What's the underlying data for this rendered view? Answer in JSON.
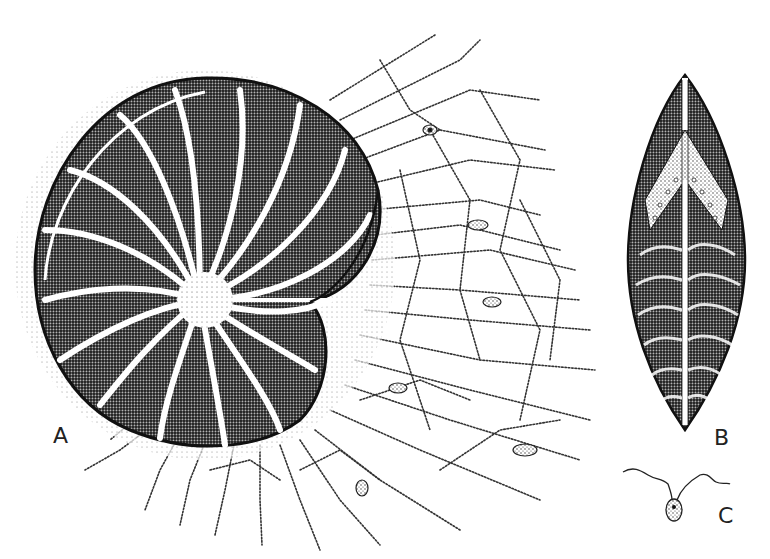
{
  "figure": {
    "type": "scientific-stipple-illustration",
    "background": "#ffffff",
    "ink": "#1a1a1a",
    "panels": [
      {
        "id": "A",
        "label": "A",
        "description": "coiled multi-chambered shell with radiating reticulate pseudopodial network"
      },
      {
        "id": "B",
        "label": "B",
        "description": "elongate spindle-shaped cell with median line and banded stippling"
      },
      {
        "id": "C",
        "label": "C",
        "description": "small oval flagellate cell with two wavy flagella"
      }
    ]
  }
}
